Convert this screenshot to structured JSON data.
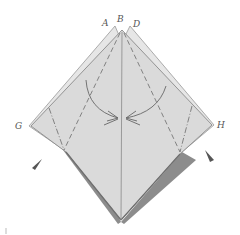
{
  "diagram": {
    "type": "origami-fold-diagram",
    "labels": {
      "A": "A",
      "B": "B",
      "D": "D",
      "G": "G",
      "H": "H"
    },
    "colors": {
      "paper": "#d9d9d9",
      "paper_light": "#e3e3e3",
      "edge": "#8a8a8a",
      "shadow_band": "#8c8c8c",
      "line": "#777777",
      "arrow": "#555555",
      "background": "#ffffff"
    },
    "elements": [
      "diamond-shaped folded paper with double-layer edges at top",
      "vertical center crease from B to bottom point",
      "two valley-fold dashed lines from top point to center",
      "two mountain-fold dash-dot lines near G and H",
      "curved fold arrows meeting at center",
      "two pointed triangle arrows below G and H (sink/push indicators)",
      "dark shadow bands along lower left and lower right edges"
    ]
  }
}
